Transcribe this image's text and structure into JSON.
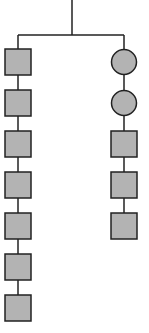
{
  "diagram": {
    "type": "tree",
    "colors": {
      "node_fill": "#b3b3b3",
      "stroke": "#222222",
      "background": "#ffffff"
    },
    "root_stem": {
      "x": 72,
      "y1": 0,
      "y2": 35
    },
    "branch_bar": {
      "y": 35,
      "x1": 18,
      "x2": 124
    },
    "left_column": {
      "x_center": 18,
      "nodes": [
        {
          "shape": "square",
          "y_top": 49
        },
        {
          "shape": "square",
          "y_top": 90
        },
        {
          "shape": "square",
          "y_top": 131
        },
        {
          "shape": "square",
          "y_top": 172
        },
        {
          "shape": "square",
          "y_top": 213
        },
        {
          "shape": "square",
          "y_top": 254
        },
        {
          "shape": "square",
          "y_top": 295
        }
      ]
    },
    "right_column": {
      "x_center": 124,
      "nodes": [
        {
          "shape": "circle",
          "y_top": 49
        },
        {
          "shape": "circle",
          "y_top": 90
        },
        {
          "shape": "square",
          "y_top": 131
        },
        {
          "shape": "square",
          "y_top": 172
        },
        {
          "shape": "square",
          "y_top": 213
        }
      ]
    },
    "node_size": 26
  }
}
